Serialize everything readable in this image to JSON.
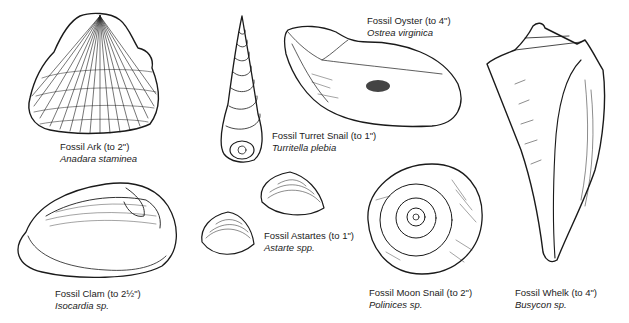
{
  "plate": {
    "width": 629,
    "height": 323,
    "background": "#ffffff",
    "ink": "#1a1a1a"
  },
  "specimens": [
    {
      "id": "ark",
      "common": "Fossil Ark (to 2\")",
      "scientific": "Anadara staminea",
      "icon": "ark-shell-icon"
    },
    {
      "id": "turret",
      "common": "Fossil Turret Snail (to 1\")",
      "scientific": "Turritella plebia",
      "icon": "turret-snail-icon"
    },
    {
      "id": "oyster",
      "common": "Fossil Oyster (to 4\")",
      "scientific": "Ostrea virginica",
      "icon": "oyster-shell-icon"
    },
    {
      "id": "whelk",
      "common": "Fossil Whelk (to 4\")",
      "scientific": "Busycon sp.",
      "icon": "whelk-shell-icon"
    },
    {
      "id": "clam",
      "common": "Fossil Clam (to 2½\")",
      "scientific": "Isocardia sp.",
      "icon": "clam-shell-icon"
    },
    {
      "id": "astartes",
      "common": "Fossil Astartes (to 1\")",
      "scientific": "Astarte spp.",
      "icon": "astarte-shells-icon"
    },
    {
      "id": "moon",
      "common": "Fossil Moon Snail (to 2\")",
      "scientific": "Polinices sp.",
      "icon": "moon-snail-icon"
    }
  ]
}
